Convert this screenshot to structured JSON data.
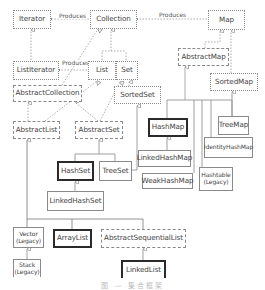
{
  "diagram": {
    "nodes": {
      "iterator": "Iterator",
      "collection": "Collection",
      "map": "Map",
      "list_iterator": "ListIterator",
      "list": "List",
      "set": "Set",
      "abstract_map": "AbstractMap",
      "abstract_collection": "AbstractCollection",
      "sorted_set": "SortedSet",
      "sorted_map": "SortedMap",
      "abstract_list": "AbstractList",
      "abstract_set": "AbstractSet",
      "hash_map": "HashMap",
      "tree_map": "TreeMap",
      "linked_hash_map": "LinkedHashMap",
      "identity_hash_map": "IdentityHashMap",
      "hash_set": "HashSet",
      "tree_set": "TreeSet",
      "weak_hash_map": "WeakHashMap",
      "hashtable": "Hashtable",
      "hashtable_note": "(Legacy)",
      "linked_hash_set": "LinkedHashSet",
      "vector": "Vector",
      "vector_note": "(Legacy)",
      "array_list": "ArrayList",
      "abstract_sequential_list": "AbstractSequentialList",
      "stack": "Stack",
      "stack_note": "(Legacy)",
      "linked_list": "LinkedList"
    },
    "edge_labels": {
      "collection_iterator": "Produces",
      "map_collection": "Produces",
      "list_listiterator": "Produces"
    },
    "legend_styles": {
      "interface": "dotted border",
      "abstract_class": "dashed border",
      "concrete_class": "solid border",
      "key_class": "bold border"
    },
    "caption": "图 — 集合框架"
  }
}
